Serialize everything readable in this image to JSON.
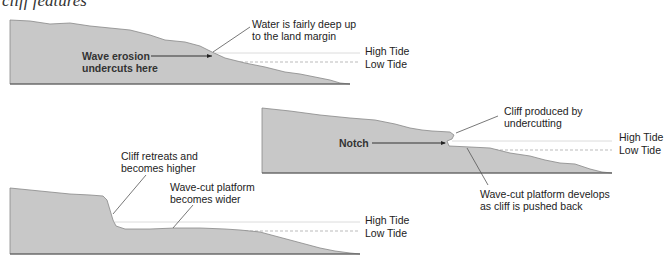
{
  "title": "cliff features",
  "colors": {
    "land": "#c8c8c8",
    "outline": "#777777",
    "high_tide_line": "#dddddd",
    "low_tide_line": "#bbbbbb",
    "text": "#222222"
  },
  "panels": [
    {
      "id": "stage-1",
      "labels": {
        "wave_erosion": [
          "Wave erosion",
          "undercuts here"
        ],
        "water_deep": [
          "Water is fairly deep up",
          "to the land margin"
        ]
      },
      "tides": {
        "high": "High Tide",
        "low": "Low Tide"
      }
    },
    {
      "id": "stage-2",
      "labels": {
        "notch": "Notch",
        "cliff_produced": [
          "Cliff produced by",
          "undercutting"
        ],
        "platform_develops": [
          "Wave-cut platform develops",
          "as cliff is pushed back"
        ]
      },
      "tides": {
        "high": "High Tide",
        "low": "Low Tide"
      }
    },
    {
      "id": "stage-3",
      "labels": {
        "cliff_retreats": [
          "Cliff retreats and",
          "becomes higher"
        ],
        "platform_wider": [
          "Wave-cut platform",
          "becomes wider"
        ]
      },
      "tides": {
        "high": "High Tide",
        "low": "Low Tide"
      }
    }
  ]
}
